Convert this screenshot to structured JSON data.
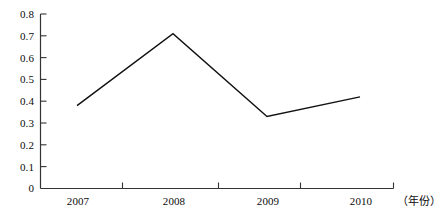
{
  "chart_data": {
    "type": "line",
    "title": "",
    "subtitle": "",
    "xlabel": "（年份）",
    "ylabel": "",
    "categories": [
      "2007",
      "2008",
      "2009",
      "2010"
    ],
    "x": [
      2007,
      2008,
      2009,
      2010
    ],
    "values": [
      0.38,
      0.71,
      0.33,
      0.42
    ],
    "series": [
      {
        "name": "",
        "values": [
          0.38,
          0.71,
          0.33,
          0.42
        ]
      }
    ],
    "ylim": [
      0,
      0.8
    ],
    "ytick_labels": [
      "0.8",
      "0.7",
      "0.6",
      "0.5",
      "0.4",
      "0.3",
      "0.2",
      "0.1",
      "0"
    ],
    "ytick_values": [
      0.8,
      0.7,
      0.6,
      0.5,
      0.4,
      0.3,
      0.2,
      0.1,
      0
    ],
    "xtick_labels": [
      "2007",
      "2008",
      "2009",
      "2010"
    ],
    "grid": false,
    "legend": null,
    "legend_position": "none",
    "line_color": "#111111",
    "axis_color": "#333333",
    "markers": false,
    "annotations": []
  },
  "axes": {
    "x_caption": "（年份）"
  }
}
